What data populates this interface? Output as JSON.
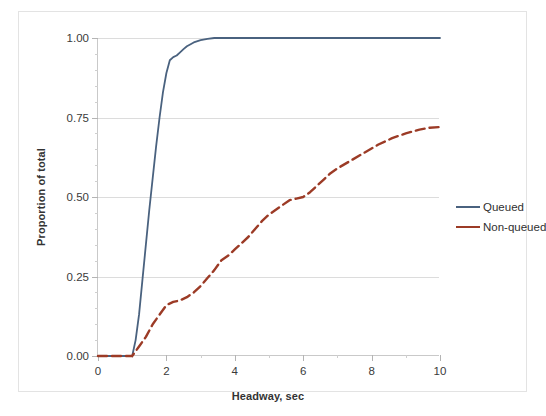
{
  "chart_data": {
    "type": "line",
    "title": "",
    "xlabel": "Headway, sec",
    "ylabel": "Proportion of total",
    "xlim": [
      0,
      10
    ],
    "ylim": [
      0,
      1.0
    ],
    "xticks": [
      0,
      2,
      4,
      6,
      8,
      10
    ],
    "xtick_labels": [
      "0",
      "2",
      "4",
      "6",
      "8",
      "10"
    ],
    "xtick_minor_step": 1,
    "yticks": [
      0.0,
      0.25,
      0.5,
      0.75,
      1.0
    ],
    "ytick_labels": [
      "0.00",
      "0.25",
      "0.50",
      "0.75",
      "1.00"
    ],
    "ytick_minor_step": 0.05,
    "grid": "horizontal-major",
    "legend_position": "right",
    "series": [
      {
        "name": "Queued",
        "color": "#4a627f",
        "style": "solid",
        "width": 1.8,
        "x": [
          0.0,
          0.5,
          0.9,
          1.0,
          1.1,
          1.2,
          1.3,
          1.4,
          1.5,
          1.6,
          1.7,
          1.8,
          1.9,
          2.0,
          2.1,
          2.2,
          2.3,
          2.4,
          2.5,
          2.6,
          2.8,
          3.0,
          3.2,
          3.4,
          3.6,
          4.0,
          5.0,
          6.0,
          7.0,
          8.0,
          9.0,
          10.0
        ],
        "y": [
          0.0,
          0.0,
          0.0,
          0.0,
          0.05,
          0.13,
          0.24,
          0.35,
          0.46,
          0.56,
          0.66,
          0.75,
          0.83,
          0.89,
          0.93,
          0.94,
          0.945,
          0.955,
          0.965,
          0.974,
          0.986,
          0.993,
          0.997,
          1.0,
          1.0,
          1.0,
          1.0,
          1.0,
          1.0,
          1.0,
          1.0,
          1.0
        ]
      },
      {
        "name": "Non-queued",
        "color": "#9c3b26",
        "style": "dashed",
        "width": 2.4,
        "x": [
          0.0,
          0.5,
          0.9,
          1.0,
          1.2,
          1.4,
          1.6,
          1.8,
          2.0,
          2.2,
          2.4,
          2.6,
          2.8,
          3.0,
          3.2,
          3.4,
          3.6,
          3.8,
          4.0,
          4.2,
          4.4,
          4.6,
          4.8,
          5.0,
          5.2,
          5.4,
          5.6,
          5.8,
          6.0,
          6.2,
          6.4,
          6.6,
          6.8,
          7.0,
          7.4,
          7.8,
          8.2,
          8.6,
          9.0,
          9.4,
          9.7,
          10.0
        ],
        "y": [
          0.0,
          0.0,
          0.0,
          0.0,
          0.03,
          0.06,
          0.1,
          0.13,
          0.16,
          0.17,
          0.175,
          0.185,
          0.2,
          0.22,
          0.245,
          0.27,
          0.3,
          0.315,
          0.335,
          0.355,
          0.375,
          0.4,
          0.425,
          0.445,
          0.46,
          0.475,
          0.49,
          0.495,
          0.5,
          0.515,
          0.535,
          0.555,
          0.575,
          0.59,
          0.615,
          0.64,
          0.665,
          0.685,
          0.7,
          0.712,
          0.718,
          0.72
        ]
      }
    ]
  },
  "legend": {
    "items": [
      {
        "label": "Queued",
        "color": "#4a627f"
      },
      {
        "label": "Non-queued",
        "color": "#9c3b26"
      }
    ]
  }
}
